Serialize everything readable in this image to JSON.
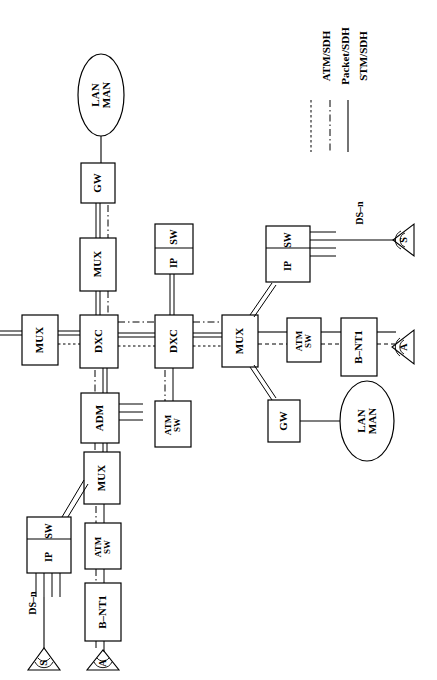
{
  "diagram": {
    "orientation": "text-rotated-90-ccw",
    "legend": {
      "name": "legend",
      "entries": [
        {
          "label": "ATM/SDH",
          "style": "dotted",
          "stroke": "#000000"
        },
        {
          "label": "Packet/SDH",
          "style": "dashdot",
          "stroke": "#000000"
        },
        {
          "label": "STM/SDH",
          "style": "solid",
          "stroke": "#000000"
        }
      ]
    },
    "nodes": [
      {
        "id": "lan_man_top",
        "label": "LAN\nMAN",
        "line1": "LAN",
        "line2": "MAN",
        "shape": "ellipse",
        "x": 78,
        "y": 95,
        "w": 46,
        "h": 82
      },
      {
        "id": "gw_top",
        "label": "GW",
        "shape": "rect",
        "x": 81,
        "y": 163,
        "w": 34,
        "h": 40
      },
      {
        "id": "mux_top",
        "label": "MUX",
        "shape": "rect",
        "x": 80,
        "y": 238,
        "w": 36,
        "h": 53
      },
      {
        "id": "mux_left",
        "label": "MUX",
        "shape": "rect",
        "x": 22,
        "y": 315,
        "w": 36,
        "h": 50
      },
      {
        "id": "dxc_1",
        "label": "DXC",
        "shape": "rect",
        "x": 80,
        "y": 315,
        "w": 38,
        "h": 53
      },
      {
        "id": "dxc_2",
        "label": "DXC",
        "shape": "rect",
        "x": 155,
        "y": 315,
        "w": 38,
        "h": 53
      },
      {
        "id": "mux_center",
        "label": "MUX",
        "shape": "rect",
        "x": 222,
        "y": 315,
        "w": 36,
        "h": 52
      },
      {
        "id": "ipsw_mid",
        "label": "IP\nSW",
        "line1": "IP",
        "line2": "SW",
        "shape": "rect-split",
        "x": 155,
        "y": 224,
        "w": 38,
        "h": 50
      },
      {
        "id": "ipsw_right",
        "label": "IP\nSW",
        "line1": "IP",
        "line2": "SW",
        "shape": "rect-split-ports",
        "x": 266,
        "y": 226,
        "w": 44,
        "h": 56
      },
      {
        "id": "adm",
        "label": "ADM",
        "shape": "rect-ports",
        "x": 81,
        "y": 393,
        "w": 38,
        "h": 50
      },
      {
        "id": "atmsw_mid",
        "label": "ATM\nSW",
        "line1": "ATM",
        "line2": "SW",
        "shape": "rect",
        "x": 155,
        "y": 401,
        "w": 36,
        "h": 46
      },
      {
        "id": "atmsw_right",
        "label": "ATM\nSW",
        "line1": "ATM",
        "line2": "SW",
        "shape": "rect",
        "x": 287,
        "y": 318,
        "w": 34,
        "h": 44
      },
      {
        "id": "bnt1_right",
        "label": "B–NT1",
        "shape": "rect",
        "x": 341,
        "y": 318,
        "w": 36,
        "h": 58
      },
      {
        "id": "mux_bottom",
        "label": "MUX",
        "shape": "rect",
        "x": 84,
        "y": 452,
        "w": 36,
        "h": 52
      },
      {
        "id": "atmsw_bottom",
        "label": "ATM\nSW",
        "line1": "ATM",
        "line2": "SW",
        "shape": "rect",
        "x": 85,
        "y": 523,
        "w": 36,
        "h": 46
      },
      {
        "id": "ipsw_bottom",
        "label": "IP\nSW",
        "line1": "IP",
        "line2": "SW",
        "shape": "rect-split-ports",
        "x": 27,
        "y": 517,
        "w": 44,
        "h": 56
      },
      {
        "id": "bnt1_bottom",
        "label": "B–NT1",
        "shape": "rect",
        "x": 85,
        "y": 583,
        "w": 36,
        "h": 58
      },
      {
        "id": "gw_right",
        "label": "GW",
        "shape": "rect",
        "x": 268,
        "y": 400,
        "w": 32,
        "h": 42
      },
      {
        "id": "lan_man_right",
        "label": "LAN\nMAN",
        "line1": "LAN",
        "line2": "MAN",
        "shape": "ellipse",
        "x": 340,
        "y": 400,
        "w": 54,
        "h": 80
      }
    ],
    "labels": [
      {
        "id": "dsn_right",
        "text": "DS–n",
        "x": 360,
        "y": 212
      },
      {
        "id": "dsn_bottom",
        "text": "DS–n",
        "x": 33,
        "y": 600
      }
    ],
    "terminals": [
      {
        "id": "ant_s_right",
        "letter": "S",
        "x": 403,
        "y": 235
      },
      {
        "id": "ant_a_right",
        "letter": "A",
        "x": 403,
        "y": 347
      },
      {
        "id": "ant_s_bottom",
        "letter": "S",
        "x": 18,
        "y": 655
      },
      {
        "id": "ant_a_bottom",
        "letter": "A",
        "x": 103,
        "y": 655
      }
    ],
    "link_types": {
      "stm_sdh": "STM/SDH",
      "packet_sdh": "Packet/SDH",
      "atm_sdh": "ATM/SDH"
    }
  }
}
